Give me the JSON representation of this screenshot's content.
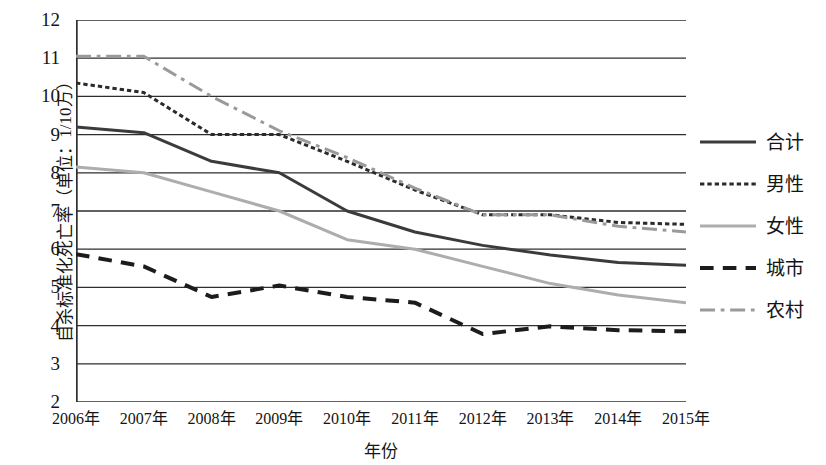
{
  "chart_data": {
    "type": "line",
    "title": "",
    "xlabel": "年份",
    "ylabel": "自杀标准化死亡率（单位：1/10万）",
    "categories": [
      "2006年",
      "2007年",
      "2008年",
      "2009年",
      "2010年",
      "2011年",
      "2012年",
      "2013年",
      "2014年",
      "2015年"
    ],
    "x_values": [
      2006,
      2007,
      2008,
      2009,
      2010,
      2011,
      2012,
      2013,
      2014,
      2015
    ],
    "ylim": [
      2,
      12
    ],
    "y_ticks": [
      2,
      3,
      4,
      5,
      6,
      7,
      8,
      9,
      10,
      11,
      12
    ],
    "grid": "horizontal",
    "legend_position": "right",
    "series": [
      {
        "name": "合计",
        "style": "solid",
        "color": "#3b3b3b",
        "width": 3,
        "values": [
          9.2,
          9.05,
          8.3,
          8.0,
          7.0,
          6.45,
          6.1,
          5.85,
          5.65,
          5.58
        ]
      },
      {
        "name": "男性",
        "style": "dotted",
        "color": "#2b2b2b",
        "width": 3,
        "values": [
          10.35,
          10.1,
          9.0,
          9.0,
          8.3,
          7.55,
          6.9,
          6.9,
          6.7,
          6.65
        ]
      },
      {
        "name": "女性",
        "style": "solid",
        "color": "#adadad",
        "width": 3,
        "values": [
          8.15,
          8.0,
          7.5,
          7.0,
          6.25,
          6.0,
          5.55,
          5.1,
          4.8,
          4.6
        ]
      },
      {
        "name": "城市",
        "style": "dashed",
        "color": "#1c1c1c",
        "width": 4,
        "values": [
          5.87,
          5.55,
          4.75,
          5.05,
          4.75,
          4.6,
          3.78,
          3.98,
          3.88,
          3.85
        ]
      },
      {
        "name": "农村",
        "style": "dashdot",
        "color": "#9a9a9a",
        "width": 3,
        "values": [
          11.05,
          11.05,
          10.0,
          9.1,
          8.4,
          7.6,
          6.9,
          6.9,
          6.6,
          6.45
        ]
      }
    ]
  },
  "axis": {
    "y_tick_labels": [
      "12",
      "11",
      "10",
      "9",
      "8",
      "7",
      "6",
      "5",
      "4",
      "3",
      "2"
    ],
    "y_title": "自杀标准化死亡率（单位：1/10万）",
    "x_title": "年份"
  },
  "legend": {
    "items": [
      {
        "label": "合计"
      },
      {
        "label": "男性"
      },
      {
        "label": "女性"
      },
      {
        "label": "城市"
      },
      {
        "label": "农村"
      }
    ]
  }
}
